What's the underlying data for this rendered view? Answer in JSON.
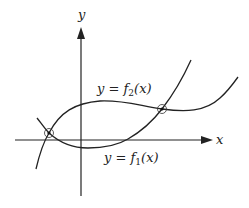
{
  "diagram": {
    "axes": {
      "x_label": "x",
      "y_label": "y"
    },
    "curves": [
      {
        "id": "f1",
        "label_prefix": "y = f",
        "label_sub": "1",
        "label_suffix": "(x)",
        "description": "cubic-like curve dipping below x-axis then rising steeply"
      },
      {
        "id": "f2",
        "label_prefix": "y = f",
        "label_sub": "2",
        "label_suffix": "(x)",
        "description": "curve with hump above x-axis, flattening then rising"
      }
    ],
    "intersections": [
      {
        "name": "left-intersection",
        "position": "left of y-axis, above x-axis"
      },
      {
        "name": "right-intersection",
        "position": "right of y-axis, above x-axis"
      }
    ]
  }
}
